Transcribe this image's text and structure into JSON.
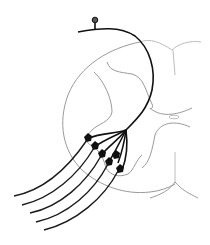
{
  "diagram": {
    "type": "neuroanatomy-schematic",
    "labels": [],
    "colors": {
      "background": "#ffffff",
      "cord_outline": "#9a9a9a",
      "neuron": "#111111",
      "cell_body_fill": "#555555"
    },
    "elements": {
      "sensory_neuron": {
        "label": "",
        "has_cell_body": true
      },
      "spinal_cord_half": {
        "label": ""
      },
      "motor_neurons": {
        "count": 6,
        "label": ""
      },
      "motor_axons": {
        "count": 5,
        "label": ""
      }
    }
  }
}
